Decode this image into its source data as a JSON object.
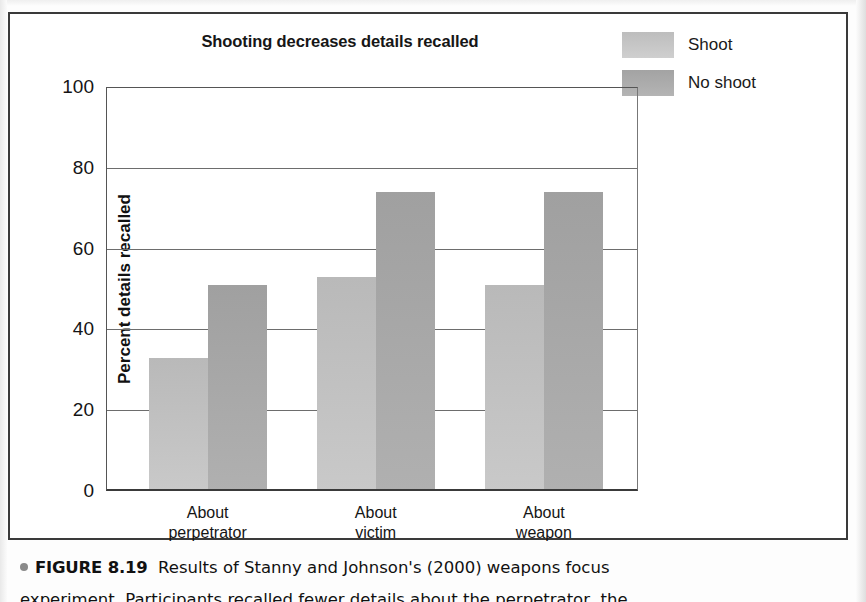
{
  "figure": {
    "panel_title": "Shooting decreases details recalled",
    "caption_bullet": "•",
    "caption_figure_number": "FIGURE 8.19",
    "caption_text": "Results of Stanny and Johnson's (2000) weapons focus",
    "caption_line2": "experiment. Participants recalled fewer details about the perpetrator, the"
  },
  "legend": {
    "items": [
      {
        "label": "Shoot",
        "color": "#c2c2c2"
      },
      {
        "label": "No shoot",
        "color": "#a8a8a8"
      }
    ]
  },
  "chart_data": {
    "type": "bar",
    "title": "Shooting decreases details recalled",
    "xlabel": "",
    "ylabel": "Percent details recalled",
    "categories": [
      "About perpetrator",
      "About victim",
      "About weapon"
    ],
    "category_lines": [
      [
        "About",
        "perpetrator"
      ],
      [
        "About",
        "victim"
      ],
      [
        "About",
        "weapon"
      ]
    ],
    "series": [
      {
        "name": "Shoot",
        "color": "#c2c2c2",
        "values": [
          33,
          53,
          51
        ]
      },
      {
        "name": "No shoot",
        "color": "#a8a8a8",
        "values": [
          51,
          74,
          74
        ]
      }
    ],
    "ylim": [
      0,
      100
    ],
    "yticks": [
      0,
      20,
      40,
      60,
      80,
      100
    ],
    "ytick_labels": [
      "0",
      "20",
      "40",
      "60",
      "80",
      "100"
    ],
    "grid": true,
    "legend_position": "top-right"
  }
}
